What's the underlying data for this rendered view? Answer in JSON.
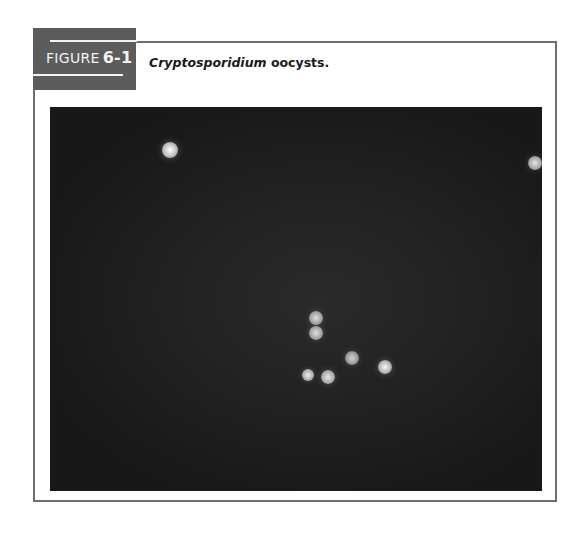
{
  "figure": {
    "label_word": "FIGURE",
    "label_number": "6-1",
    "caption_italic": "Cryptosporidium",
    "caption_rest": " oocysts."
  },
  "micrograph": {
    "description": "Fluorescence micrograph of Cryptosporidium oocysts on dark background",
    "oocysts": [
      {
        "x": 120,
        "y": 43,
        "r": 8,
        "brightness": 1.0
      },
      {
        "x": 485,
        "y": 56,
        "r": 7,
        "brightness": 0.75
      },
      {
        "x": 266,
        "y": 211,
        "r": 7,
        "brightness": 0.7
      },
      {
        "x": 266,
        "y": 226,
        "r": 7,
        "brightness": 0.72
      },
      {
        "x": 302,
        "y": 251,
        "r": 7,
        "brightness": 0.6
      },
      {
        "x": 335,
        "y": 260,
        "r": 7,
        "brightness": 0.92
      },
      {
        "x": 258,
        "y": 268,
        "r": 6,
        "brightness": 0.85
      },
      {
        "x": 278,
        "y": 270,
        "r": 7,
        "brightness": 0.8
      }
    ]
  }
}
